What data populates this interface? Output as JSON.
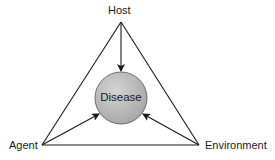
{
  "diagram": {
    "nodes": {
      "top": {
        "label": "Host"
      },
      "left": {
        "label": "Agent"
      },
      "right": {
        "label": "Environment"
      },
      "center": {
        "label": "Disease"
      }
    },
    "edges": [
      {
        "from": "Host",
        "to": "Disease",
        "type": "arrow"
      },
      {
        "from": "Agent",
        "to": "Disease",
        "type": "arrow"
      },
      {
        "from": "Environment",
        "to": "Disease",
        "type": "arrow"
      },
      {
        "from": "Host",
        "to": "Agent",
        "type": "line"
      },
      {
        "from": "Host",
        "to": "Environment",
        "type": "line"
      },
      {
        "from": "Agent",
        "to": "Environment",
        "type": "line"
      }
    ],
    "colors": {
      "stroke": "#1a1a1a",
      "circle_fill": "#b8b8b8",
      "background": "#ffffff"
    }
  }
}
